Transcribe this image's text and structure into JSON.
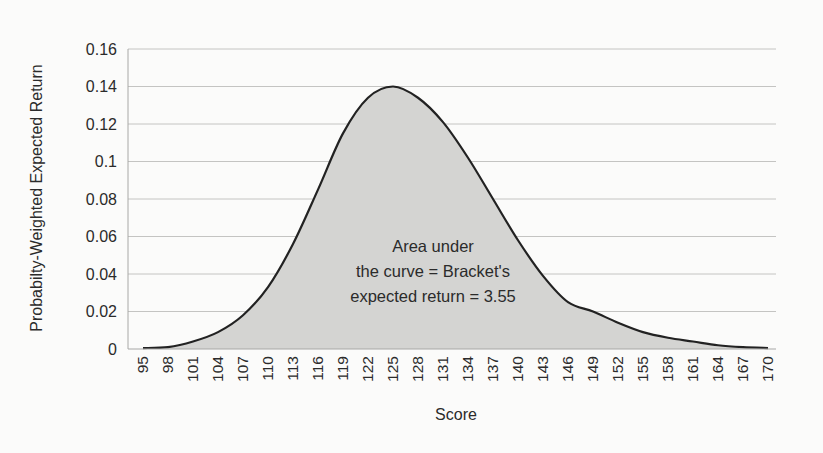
{
  "chart_data": {
    "type": "area",
    "title": "",
    "xlabel": "Score",
    "ylabel": "Probabilty-Weighted Expected Return",
    "ylim": [
      0,
      0.16
    ],
    "yticks": [
      0,
      0.02,
      0.04,
      0.06,
      0.08,
      0.1,
      0.12,
      0.14,
      0.16
    ],
    "ytick_labels": [
      "0",
      "0.02",
      "0.04",
      "0.06",
      "0.08",
      "0.1",
      "0.12",
      "0.14",
      "0.16"
    ],
    "grid": true,
    "legend": null,
    "categories": [
      "95",
      "98",
      "101",
      "104",
      "107",
      "110",
      "113",
      "116",
      "119",
      "122",
      "125",
      "128",
      "131",
      "134",
      "137",
      "140",
      "143",
      "146",
      "149",
      "152",
      "155",
      "158",
      "161",
      "164",
      "167",
      "170"
    ],
    "series": [
      {
        "name": "Probability-Weighted Expected Return",
        "values": [
          0.0005,
          0.001,
          0.004,
          0.009,
          0.018,
          0.033,
          0.056,
          0.085,
          0.115,
          0.134,
          0.14,
          0.134,
          0.121,
          0.102,
          0.08,
          0.058,
          0.039,
          0.025,
          0.02,
          0.014,
          0.009,
          0.006,
          0.004,
          0.002,
          0.001,
          0.0005
        ]
      }
    ],
    "annotation": {
      "lines": [
        "Area under",
        "the curve = Bracket's",
        "expected return = 3.55"
      ]
    },
    "colors": {
      "fill": "#d4d4d2",
      "line": "#222222",
      "grid": "#c4c4c2",
      "axis": "#a8a8a6"
    }
  }
}
